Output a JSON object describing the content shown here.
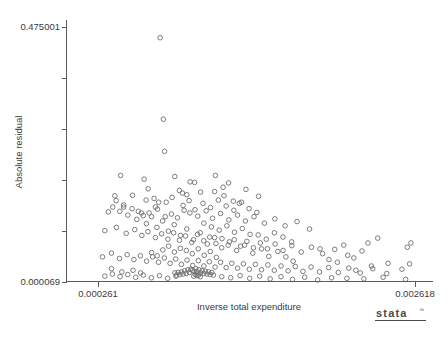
{
  "chart_data": {
    "type": "scatter",
    "title": "",
    "xlabel": "Inverse total expenditure",
    "ylabel": "Absolute residual",
    "xlim": [
      0.000261,
      0.002618
    ],
    "ylim": [
      6.9e-05,
      0.475001
    ],
    "xticks": [
      0.000261,
      0.002618
    ],
    "xtick_labels": [
      "0.000261",
      "0.002618"
    ],
    "yticks": [
      6.9e-05,
      0.475001
    ],
    "ytick_labels": [
      "0.000069",
      "0.475001"
    ],
    "y_minor_tick_count": 4,
    "grid": false,
    "legend": null,
    "marker": "open-circle",
    "marker_color": "#6e6e6e",
    "points": [
      [
        0.000723,
        0.455
      ],
      [
        0.000747,
        0.303
      ],
      [
        0.000756,
        0.243
      ],
      [
        0.000429,
        0.198
      ],
      [
        0.000604,
        0.191
      ],
      [
        0.000832,
        0.196
      ],
      [
        0.000946,
        0.186
      ],
      [
        0.000979,
        0.185
      ],
      [
        0.001134,
        0.198
      ],
      [
        0.001232,
        0.184
      ],
      [
        0.001361,
        0.172
      ],
      [
        0.000386,
        0.16
      ],
      [
        0.000518,
        0.161
      ],
      [
        0.000619,
        0.152
      ],
      [
        0.000678,
        0.155
      ],
      [
        0.000712,
        0.148
      ],
      [
        0.000866,
        0.17
      ],
      [
        0.000889,
        0.165
      ],
      [
        0.000921,
        0.162
      ],
      [
        0.001024,
        0.167
      ],
      [
        0.001198,
        0.16
      ],
      [
        0.001267,
        0.15
      ],
      [
        0.001312,
        0.146
      ],
      [
        0.001455,
        0.159
      ],
      [
        0.000338,
        0.13
      ],
      [
        0.000452,
        0.139
      ],
      [
        0.000561,
        0.131
      ],
      [
        0.000598,
        0.123
      ],
      [
        0.000641,
        0.128
      ],
      [
        0.000703,
        0.135
      ],
      [
        0.000761,
        0.121
      ],
      [
        0.000807,
        0.126
      ],
      [
        0.000852,
        0.119
      ],
      [
        0.000901,
        0.133
      ],
      [
        0.000944,
        0.128
      ],
      [
        0.001003,
        0.122
      ],
      [
        0.001065,
        0.132
      ],
      [
        0.001112,
        0.118
      ],
      [
        0.001172,
        0.127
      ],
      [
        0.001234,
        0.115
      ],
      [
        0.001298,
        0.124
      ],
      [
        0.001357,
        0.113
      ],
      [
        0.001421,
        0.121
      ],
      [
        0.001498,
        0.109
      ],
      [
        0.001576,
        0.117
      ],
      [
        0.001652,
        0.104
      ],
      [
        0.001741,
        0.112
      ],
      [
        0.001834,
        0.098
      ],
      [
        0.000312,
        0.095
      ],
      [
        0.000398,
        0.101
      ],
      [
        0.000471,
        0.09
      ],
      [
        0.000534,
        0.097
      ],
      [
        0.000587,
        0.086
      ],
      [
        0.000632,
        0.093
      ],
      [
        0.000688,
        0.082
      ],
      [
        0.000734,
        0.089
      ],
      [
        0.000781,
        0.079
      ],
      [
        0.000823,
        0.091
      ],
      [
        0.000867,
        0.077
      ],
      [
        0.000912,
        0.085
      ],
      [
        0.000958,
        0.073
      ],
      [
        0.001001,
        0.088
      ],
      [
        0.001047,
        0.076
      ],
      [
        0.001092,
        0.083
      ],
      [
        0.001138,
        0.071
      ],
      [
        0.001183,
        0.08
      ],
      [
        0.001229,
        0.068
      ],
      [
        0.001274,
        0.078
      ],
      [
        0.001321,
        0.066
      ],
      [
        0.001368,
        0.075
      ],
      [
        0.001417,
        0.063
      ],
      [
        0.001468,
        0.072
      ],
      [
        0.001521,
        0.061
      ],
      [
        0.001578,
        0.07
      ],
      [
        0.001637,
        0.058
      ],
      [
        0.001702,
        0.067
      ],
      [
        0.001772,
        0.055
      ],
      [
        0.001848,
        0.064
      ],
      [
        0.001931,
        0.052
      ],
      [
        0.002021,
        0.06
      ],
      [
        0.002118,
        0.049
      ],
      [
        0.002224,
        0.057
      ],
      [
        0.000294,
        0.046
      ],
      [
        0.000361,
        0.053
      ],
      [
        0.000421,
        0.043
      ],
      [
        0.000478,
        0.05
      ],
      [
        0.000528,
        0.041
      ],
      [
        0.000576,
        0.048
      ],
      [
        0.000622,
        0.038
      ],
      [
        0.000667,
        0.046
      ],
      [
        0.000711,
        0.036
      ],
      [
        0.000754,
        0.044
      ],
      [
        0.000797,
        0.034
      ],
      [
        0.000839,
        0.042
      ],
      [
        0.000881,
        0.032
      ],
      [
        0.000923,
        0.04
      ],
      [
        0.000965,
        0.03
      ],
      [
        0.001007,
        0.039
      ],
      [
        0.001048,
        0.029
      ],
      [
        0.001089,
        0.037
      ],
      [
        0.001131,
        0.027
      ],
      [
        0.001172,
        0.036
      ],
      [
        0.001214,
        0.026
      ],
      [
        0.001256,
        0.034
      ],
      [
        0.001299,
        0.025
      ],
      [
        0.001342,
        0.033
      ],
      [
        0.001386,
        0.023
      ],
      [
        0.001431,
        0.032
      ],
      [
        0.001477,
        0.022
      ],
      [
        0.001524,
        0.031
      ],
      [
        0.001572,
        0.021
      ],
      [
        0.001622,
        0.029
      ],
      [
        0.001674,
        0.02
      ],
      [
        0.001728,
        0.028
      ],
      [
        0.001785,
        0.019
      ],
      [
        0.001845,
        0.027
      ],
      [
        0.001908,
        0.018
      ],
      [
        0.001976,
        0.026
      ],
      [
        0.002048,
        0.017
      ],
      [
        0.002126,
        0.025
      ],
      [
        0.002211,
        0.016
      ],
      [
        0.002304,
        0.024
      ],
      [
        0.002408,
        0.015
      ],
      [
        0.002521,
        0.023
      ],
      [
        0.000951,
        0.023
      ],
      [
        0.000963,
        0.021
      ],
      [
        0.000975,
        0.019
      ],
      [
        0.000987,
        0.024
      ],
      [
        0.000999,
        0.018
      ],
      [
        0.001011,
        0.022
      ],
      [
        0.001023,
        0.016
      ],
      [
        0.001035,
        0.02
      ],
      [
        0.001047,
        0.015
      ],
      [
        0.001059,
        0.019
      ],
      [
        0.000941,
        0.017
      ],
      [
        0.000929,
        0.022
      ],
      [
        0.000917,
        0.015
      ],
      [
        0.000905,
        0.02
      ],
      [
        0.000893,
        0.014
      ],
      [
        0.000881,
        0.018
      ],
      [
        0.000869,
        0.013
      ],
      [
        0.000857,
        0.017
      ],
      [
        0.000845,
        0.012
      ],
      [
        0.000833,
        0.016
      ],
      [
        0.001071,
        0.014
      ],
      [
        0.001083,
        0.018
      ],
      [
        0.001095,
        0.013
      ],
      [
        0.001107,
        0.017
      ],
      [
        0.001119,
        0.012
      ],
      [
        0.000997,
        0.011
      ],
      [
        0.000985,
        0.013
      ],
      [
        0.000973,
        0.01
      ],
      [
        0.001009,
        0.012
      ],
      [
        0.001021,
        0.009
      ],
      [
        0.000312,
        0.01
      ],
      [
        0.000368,
        0.014
      ],
      [
        0.000425,
        0.009
      ],
      [
        0.000482,
        0.013
      ],
      [
        0.000541,
        0.008
      ],
      [
        0.000598,
        0.012
      ],
      [
        0.000658,
        0.007
      ],
      [
        0.000718,
        0.011
      ],
      [
        0.000779,
        0.006
      ],
      [
        0.000841,
        0.01
      ],
      [
        0.001181,
        0.009
      ],
      [
        0.001248,
        0.007
      ],
      [
        0.001318,
        0.011
      ],
      [
        0.001389,
        0.006
      ],
      [
        0.001463,
        0.01
      ],
      [
        0.001541,
        0.005
      ],
      [
        0.001622,
        0.009
      ],
      [
        0.001707,
        0.004
      ],
      [
        0.001798,
        0.008
      ],
      [
        0.001894,
        0.003
      ],
      [
        0.001998,
        0.007
      ],
      [
        0.002112,
        0.006
      ],
      [
        0.002238,
        0.005
      ],
      [
        0.002381,
        0.008
      ],
      [
        0.002548,
        0.004
      ],
      [
        0.002588,
        0.072
      ],
      [
        0.002561,
        0.064
      ],
      [
        0.002578,
        0.033
      ],
      [
        0.002341,
        0.081
      ],
      [
        0.002268,
        0.072
      ],
      [
        0.002163,
        0.044
      ],
      [
        0.002041,
        0.036
      ],
      [
        0.001912,
        0.061
      ],
      [
        0.001978,
        0.041
      ],
      [
        0.002088,
        0.068
      ],
      [
        0.001658,
        0.046
      ],
      [
        0.001712,
        0.038
      ],
      [
        0.001598,
        0.056
      ],
      [
        0.001531,
        0.047
      ],
      [
        0.001477,
        0.061
      ],
      [
        0.001412,
        0.053
      ],
      [
        0.001351,
        0.068
      ],
      [
        0.001292,
        0.058
      ],
      [
        0.001238,
        0.074
      ],
      [
        0.001181,
        0.063
      ],
      [
        0.001128,
        0.082
      ],
      [
        0.001074,
        0.07
      ],
      [
        0.001021,
        0.091
      ],
      [
        0.000971,
        0.078
      ],
      [
        0.000921,
        0.098
      ],
      [
        0.000874,
        0.086
      ],
      [
        0.000828,
        0.106
      ],
      [
        0.000784,
        0.094
      ],
      [
        0.000741,
        0.113
      ],
      [
        0.000699,
        0.101
      ],
      [
        0.000659,
        0.121
      ],
      [
        0.000621,
        0.108
      ],
      [
        0.000584,
        0.128
      ],
      [
        0.000549,
        0.116
      ],
      [
        0.000515,
        0.136
      ],
      [
        0.000483,
        0.124
      ],
      [
        0.000452,
        0.143
      ],
      [
        0.000423,
        0.131
      ],
      [
        0.000396,
        0.151
      ],
      [
        0.000371,
        0.139
      ],
      [
        0.001042,
        0.146
      ],
      [
        0.001098,
        0.138
      ],
      [
        0.001156,
        0.152
      ],
      [
        0.001214,
        0.141
      ],
      [
        0.001271,
        0.133
      ],
      [
        0.001328,
        0.148
      ],
      [
        0.001384,
        0.136
      ],
      [
        0.001442,
        0.129
      ],
      [
        0.000894,
        0.142
      ],
      [
        0.000938,
        0.151
      ],
      [
        0.000982,
        0.134
      ],
      [
        0.001128,
        0.168
      ],
      [
        0.001191,
        0.176
      ],
      [
        0.000812,
        0.157
      ],
      [
        0.000768,
        0.148
      ],
      [
        0.000688,
        0.139
      ],
      [
        0.000634,
        0.173
      ],
      [
        0.001048,
        0.109
      ],
      [
        0.001104,
        0.102
      ],
      [
        0.001162,
        0.096
      ],
      [
        0.001219,
        0.104
      ],
      [
        0.001276,
        0.092
      ],
      [
        0.001334,
        0.099
      ],
      [
        0.001392,
        0.088
      ],
      [
        0.000918,
        0.058
      ],
      [
        0.000962,
        0.052
      ],
      [
        0.001006,
        0.061
      ],
      [
        0.001051,
        0.049
      ],
      [
        0.001096,
        0.056
      ],
      [
        0.001141,
        0.045
      ],
      [
        0.000873,
        0.062
      ],
      [
        0.000829,
        0.055
      ],
      [
        0.000786,
        0.066
      ],
      [
        0.000743,
        0.059
      ],
      [
        0.000701,
        0.048
      ],
      [
        0.000659,
        0.054
      ],
      [
        0.001452,
        0.087
      ],
      [
        0.001512,
        0.079
      ],
      [
        0.001573,
        0.091
      ],
      [
        0.001636,
        0.083
      ],
      [
        0.001701,
        0.074
      ],
      [
        0.000521,
        0.021
      ],
      [
        0.000578,
        0.016
      ],
      [
        0.000438,
        0.018
      ],
      [
        0.000361,
        0.024
      ],
      [
        0.002418,
        0.034
      ],
      [
        0.002294,
        0.029
      ],
      [
        0.002178,
        0.021
      ]
    ]
  },
  "branding": {
    "logo_text": "stata",
    "logo_tm": "™"
  }
}
